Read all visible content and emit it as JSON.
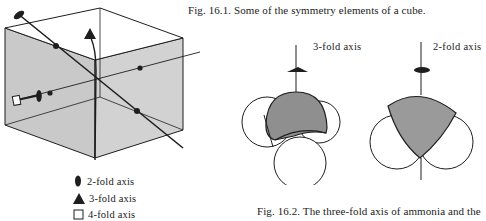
{
  "figure1": {
    "caption": "Fig. 16.1.  Some of the symmetry elements of a cube.",
    "legend": [
      {
        "symbol": "ellipse-filled",
        "label": "2-fold  axis"
      },
      {
        "symbol": "triangle-filled",
        "label": "3-fold  axis"
      },
      {
        "symbol": "square-open",
        "label": "4-fold  axis"
      }
    ],
    "colors": {
      "face": "#c8c8c8",
      "line": "#1e1e1e"
    }
  },
  "figure2": {
    "caption": "Fig. 16.2. The three-fold axis of ammonia and the",
    "left_axis_label": "3-fold  axis",
    "right_axis_label": "2-fold  axis",
    "colors": {
      "atom_shaded": "#8f8f8f",
      "atom_open": "#ffffff"
    }
  }
}
